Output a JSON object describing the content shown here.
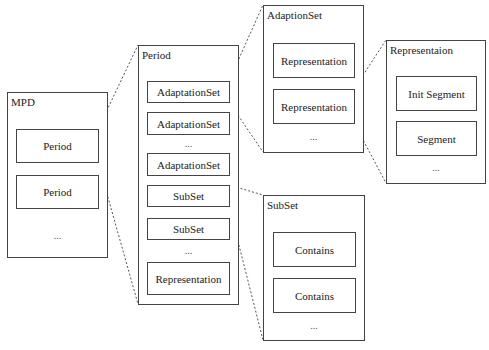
{
  "diagram": {
    "colors": {
      "stroke": "#444444",
      "connector": "#555555",
      "background": "#ffffff"
    },
    "mpd": {
      "title": "MPD",
      "items": [
        "Period",
        "Period"
      ],
      "ellipsis": "..."
    },
    "period": {
      "title": "Period",
      "items": [
        "AdaptationSet",
        "AdaptationSet",
        "AdaptationSet",
        "SubSet",
        "SubSet",
        "Representation"
      ],
      "ellipsis": [
        "...",
        "..."
      ]
    },
    "adaptation_set": {
      "title": "AdaptionSet",
      "items": [
        "Representation",
        "Representation"
      ],
      "ellipsis": "..."
    },
    "representation": {
      "title": "Representaion",
      "items": [
        "Init Segment",
        "Segment"
      ],
      "ellipsis": "..."
    },
    "subset": {
      "title": "SubSet",
      "items": [
        "Contains",
        "Contains"
      ],
      "ellipsis": "..."
    },
    "connectors": [
      {
        "from": "mpd.Period[0]",
        "to": "period"
      },
      {
        "from": "period.AdaptationSet[0]",
        "to": "adaptation_set"
      },
      {
        "from": "adaptation_set.Representation[1]",
        "to": "representation"
      },
      {
        "from": "period.SubSet[0]",
        "to": "subset"
      }
    ]
  }
}
